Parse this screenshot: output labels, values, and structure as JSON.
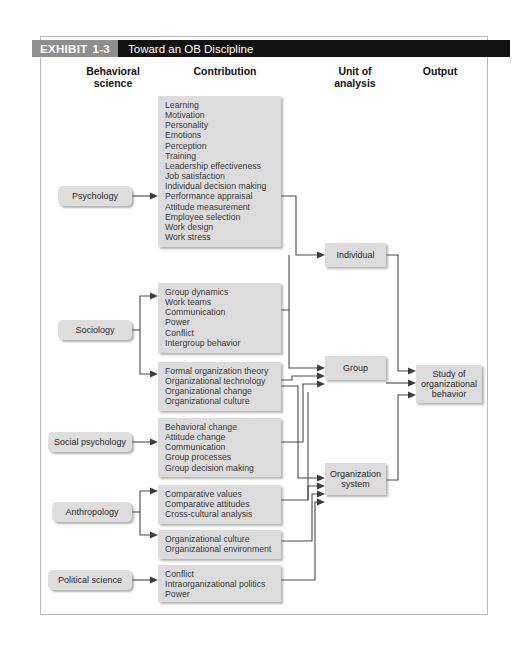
{
  "header": {
    "exhibit_word": "EXHIBIT",
    "exhibit_number": "1-3",
    "title": "Toward an OB Discipline"
  },
  "columns": {
    "behavioral_science": "Behavioral\nscience",
    "behavioral_science_line1": "Behavioral",
    "behavioral_science_line2": "science",
    "contribution": "Contribution",
    "unit_line1": "Unit of",
    "unit_line2": "analysis",
    "output": "Output"
  },
  "disciplines": [
    {
      "id": "psychology",
      "label": "Psychology"
    },
    {
      "id": "sociology",
      "label": "Sociology"
    },
    {
      "id": "social-psychology",
      "label": "Social psychology"
    },
    {
      "id": "anthropology",
      "label": "Anthropology"
    },
    {
      "id": "political-science",
      "label": "Political science"
    }
  ],
  "contribution_groups": [
    {
      "id": "psychology-contributions",
      "source": "Psychology",
      "items": [
        "Learning",
        "Motivation",
        "Personality",
        "Emotions",
        "Perception",
        "Training",
        "Leadership effectiveness",
        "Job satisfaction",
        "Individual decision making",
        "Performance appraisal",
        "Attitude measurement",
        "Employee selection",
        "Work design",
        "Work stress"
      ]
    },
    {
      "id": "sociology-group-contributions",
      "source": "Sociology",
      "items": [
        "Group dynamics",
        "Work teams",
        "Communication",
        "Power",
        "Conflict",
        "Intergroup behavior"
      ]
    },
    {
      "id": "sociology-organization-contributions",
      "source": "Sociology",
      "items": [
        "Formal organization theory",
        "Organizational technology",
        "Organizational change",
        "Organizational culture"
      ]
    },
    {
      "id": "social-psychology-contributions",
      "source": "Social psychology",
      "items": [
        "Behavioral change",
        "Attitude change",
        "Communication",
        "Group processes",
        "Group decision making"
      ]
    },
    {
      "id": "anthropology-group-contributions",
      "source": "Anthropology",
      "items": [
        "Comparative values",
        "Comparative attitudes",
        "Cross-cultural analysis"
      ]
    },
    {
      "id": "anthropology-organization-contributions",
      "source": "Anthropology",
      "items": [
        "Organizational culture",
        "Organizational environment"
      ]
    },
    {
      "id": "political-science-contributions",
      "source": "Political science",
      "items": [
        "Conflict",
        "Intraorganizational politics",
        "Power"
      ]
    }
  ],
  "units_of_analysis": [
    {
      "id": "individual",
      "label": "Individual"
    },
    {
      "id": "group",
      "label": "Group"
    },
    {
      "id": "organization-system",
      "line1": "Organization",
      "line2": "system"
    }
  ],
  "output": {
    "id": "study-of-organizational-behavior",
    "line1": "Study of",
    "line2": "organizational",
    "line3": "behavior"
  },
  "colors": {
    "tag_background": "#8e8e8e",
    "title_background": "#111111",
    "title_text": "#ffffff",
    "box_fill": "#dcdcdc",
    "box_text": "#2b2b2b",
    "connector": "#4a4a4a",
    "frame_border": "#b9b9b9",
    "page_background": "#ffffff"
  }
}
